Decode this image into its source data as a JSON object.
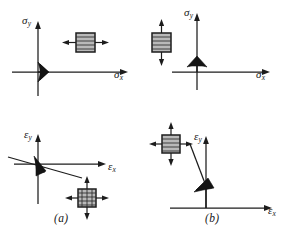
{
  "figure": {
    "type": "technical-diagram",
    "background_color": "#ffffff",
    "ink_color": "#1c1c1c",
    "element_fill_color": "#b9b9b9"
  },
  "panels": [
    {
      "id": "a",
      "caption": "(a)",
      "diagrams": [
        {
          "id": "a-stress",
          "kind": "stress-plane",
          "x_axis_label": "σ",
          "x_axis_subscript": "x",
          "y_axis_label": "σ",
          "y_axis_subscript": "y",
          "vector_direction": "positive-x",
          "vector_description": "stress vector along positive sigma-x axis",
          "element": {
            "name": "stress-element-uniaxial-x",
            "hatching": "horizontal",
            "arrows": [
              "left",
              "right"
            ],
            "arrow_count": 2,
            "description": "element in uniaxial tension along x"
          }
        },
        {
          "id": "a-strain",
          "kind": "strain-plane",
          "x_axis_label": "ε",
          "x_axis_subscript": "x",
          "y_axis_label": "ε",
          "y_axis_subscript": "y",
          "vector_direction": "fourth-quadrant-shallow",
          "vector_description": "strain vector below the epsilon-x axis indicating lateral contraction",
          "guide_line": "inclined line through origin",
          "element": {
            "name": "strain-element-biaxial",
            "hatching": "cross",
            "arrows": [
              "left",
              "right",
              "up",
              "down"
            ],
            "arrow_count": 4,
            "description": "element elongating in x and contracting in y"
          }
        }
      ]
    },
    {
      "id": "b",
      "caption": "(b)",
      "diagrams": [
        {
          "id": "b-stress",
          "kind": "stress-plane",
          "x_axis_label": "σ",
          "x_axis_subscript": "x",
          "y_axis_label": "σ",
          "y_axis_subscript": "y",
          "vector_direction": "positive-y",
          "vector_description": "stress vector along positive sigma-y axis",
          "element": {
            "name": "stress-element-uniaxial-y",
            "hatching": "horizontal",
            "arrows": [
              "up",
              "down"
            ],
            "arrow_count": 2,
            "description": "element in uniaxial tension along y"
          }
        },
        {
          "id": "b-strain",
          "kind": "strain-plane",
          "x_axis_label": "ε",
          "x_axis_subscript": "x",
          "y_axis_label": "ε",
          "y_axis_subscript": "y",
          "vector_direction": "positive-y-with-leader",
          "vector_description": "strain vector along epsilon-y axis connected by leader line to element",
          "guide_line": "leader line from element to vector tip",
          "element": {
            "name": "strain-element-biaxial",
            "hatching": "horizontal",
            "arrows": [
              "left",
              "right",
              "up",
              "down"
            ],
            "arrow_count": 4,
            "description": "element elongating in y and contracting in x"
          }
        }
      ]
    }
  ]
}
